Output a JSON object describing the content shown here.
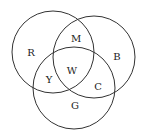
{
  "diagram": {
    "type": "venn",
    "sets": [
      {
        "id": "R",
        "label": "R",
        "cx": 53,
        "cy": 52,
        "r": 41
      },
      {
        "id": "B",
        "label": "B",
        "cx": 94,
        "cy": 57,
        "r": 41
      },
      {
        "id": "G",
        "label": "G",
        "cx": 74,
        "cy": 88,
        "r": 41
      }
    ],
    "regions": [
      {
        "label": "R",
        "sets": [
          "R"
        ],
        "x": 31,
        "y": 53
      },
      {
        "label": "B",
        "sets": [
          "B"
        ],
        "x": 117,
        "y": 57
      },
      {
        "label": "G",
        "sets": [
          "G"
        ],
        "x": 75,
        "y": 106
      },
      {
        "label": "M",
        "sets": [
          "R",
          "B"
        ],
        "x": 76,
        "y": 39
      },
      {
        "label": "Y",
        "sets": [
          "R",
          "G"
        ],
        "x": 49,
        "y": 80
      },
      {
        "label": "C",
        "sets": [
          "B",
          "G"
        ],
        "x": 98,
        "y": 87
      },
      {
        "label": "W",
        "sets": [
          "R",
          "B",
          "G"
        ],
        "x": 72,
        "y": 71
      }
    ],
    "stroke_color": "#333333",
    "background": "#ffffff"
  }
}
